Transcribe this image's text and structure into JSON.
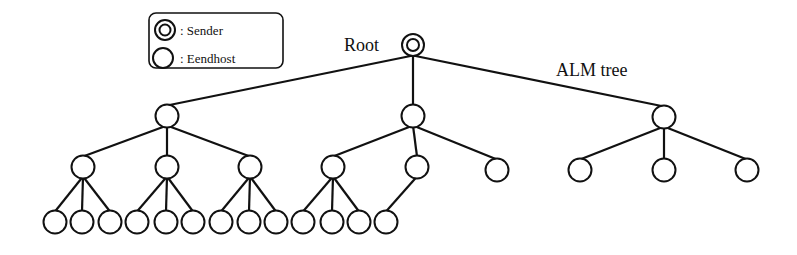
{
  "legend": {
    "items": [
      {
        "symbol": "double-circle",
        "label": ": Sender"
      },
      {
        "symbol": "circle",
        "label": ": Eendhost"
      }
    ]
  },
  "labels": {
    "root": "Root",
    "tree": "ALM tree"
  },
  "tree": {
    "root": {
      "id": "root",
      "x": 413,
      "y": 45,
      "type": "sender"
    },
    "nodes": [
      {
        "id": "a",
        "x": 167,
        "y": 116,
        "parent": "root"
      },
      {
        "id": "b",
        "x": 413,
        "y": 116,
        "parent": "root"
      },
      {
        "id": "c",
        "x": 664,
        "y": 117,
        "parent": "root"
      },
      {
        "id": "a1",
        "x": 83,
        "y": 167,
        "parent": "a"
      },
      {
        "id": "a2",
        "x": 167,
        "y": 167,
        "parent": "a"
      },
      {
        "id": "a3",
        "x": 250,
        "y": 167,
        "parent": "a"
      },
      {
        "id": "b1",
        "x": 333,
        "y": 167,
        "parent": "b"
      },
      {
        "id": "b2",
        "x": 417,
        "y": 167,
        "parent": "b"
      },
      {
        "id": "b3",
        "x": 497,
        "y": 170,
        "parent": "b"
      },
      {
        "id": "c1",
        "x": 580,
        "y": 170,
        "parent": "c"
      },
      {
        "id": "c2",
        "x": 664,
        "y": 170,
        "parent": "c"
      },
      {
        "id": "c3",
        "x": 747,
        "y": 170,
        "parent": "c"
      },
      {
        "id": "a1a",
        "x": 55,
        "y": 222,
        "parent": "a1"
      },
      {
        "id": "a1b",
        "x": 82,
        "y": 222,
        "parent": "a1"
      },
      {
        "id": "a1c",
        "x": 110,
        "y": 222,
        "parent": "a1"
      },
      {
        "id": "a2a",
        "x": 137,
        "y": 222,
        "parent": "a2"
      },
      {
        "id": "a2b",
        "x": 166,
        "y": 222,
        "parent": "a2"
      },
      {
        "id": "a2c",
        "x": 193,
        "y": 222,
        "parent": "a2"
      },
      {
        "id": "a3a",
        "x": 221,
        "y": 222,
        "parent": "a3"
      },
      {
        "id": "a3b",
        "x": 249,
        "y": 222,
        "parent": "a3"
      },
      {
        "id": "a3c",
        "x": 276,
        "y": 222,
        "parent": "a3"
      },
      {
        "id": "b1a",
        "x": 303,
        "y": 222,
        "parent": "b1"
      },
      {
        "id": "b1b",
        "x": 332,
        "y": 222,
        "parent": "b1"
      },
      {
        "id": "b1c",
        "x": 359,
        "y": 222,
        "parent": "b1"
      },
      {
        "id": "b2a",
        "x": 386,
        "y": 222,
        "parent": "b2"
      }
    ],
    "node_radius": 11.5,
    "colors": {
      "stroke": "#111111",
      "fill": "#ffffff"
    }
  }
}
